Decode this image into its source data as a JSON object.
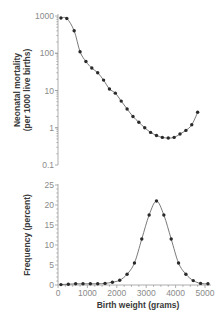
{
  "chart_data": [
    {
      "type": "line",
      "title": "",
      "xlabel": "",
      "ylabel": "Neonatal mortality (per 1000 live births)",
      "ylabel_lines": [
        "Neonatal mortality",
        "(per 1000 live births)"
      ],
      "yscale": "log",
      "ylim": [
        0.1,
        1000
      ],
      "xlim": [
        0,
        5200
      ],
      "yticks": [
        1000,
        100,
        10,
        1,
        0.1
      ],
      "ytick_labels": [
        "1000",
        "100",
        "10",
        "1",
        "0.1"
      ],
      "grid": false,
      "series": [
        {
          "name": "Neonatal mortality",
          "x": [
            100,
            300,
            550,
            750,
            950,
            1150,
            1350,
            1550,
            1750,
            1950,
            2150,
            2350,
            2550,
            2750,
            2950,
            3150,
            3350,
            3550,
            3750,
            3950,
            4150,
            4350,
            4550,
            4750
          ],
          "y": [
            880,
            860,
            400,
            110,
            60,
            40,
            30,
            19,
            11,
            8.5,
            5.2,
            3.2,
            2.0,
            1.4,
            1.0,
            0.75,
            0.62,
            0.55,
            0.53,
            0.55,
            0.68,
            0.85,
            1.2,
            2.6
          ]
        }
      ]
    },
    {
      "type": "line",
      "title": "",
      "xlabel": "Birth weight (grams)",
      "ylabel": "Frequency (percent)",
      "ylim": [
        0,
        25
      ],
      "xlim": [
        0,
        5200
      ],
      "yticks": [
        0,
        5,
        10,
        15,
        20,
        25
      ],
      "ytick_labels": [
        "0",
        "5",
        "10",
        "15",
        "20",
        "25"
      ],
      "xticks": [
        0,
        1000,
        2000,
        3000,
        4000,
        5000
      ],
      "xtick_labels": [
        "0",
        "1000",
        "2000",
        "3000",
        "4000",
        "5000"
      ],
      "grid": false,
      "series": [
        {
          "name": "Birth weight frequency",
          "x": [
            100,
            350,
            600,
            850,
            1100,
            1350,
            1600,
            1850,
            2100,
            2350,
            2600,
            2850,
            3100,
            3350,
            3600,
            3850,
            4100,
            4350,
            4600,
            4850,
            5100
          ],
          "y": [
            0.1,
            0.2,
            0.3,
            0.3,
            0.3,
            0.3,
            0.4,
            0.7,
            1.2,
            2.7,
            5.5,
            11.5,
            17.5,
            21,
            17.5,
            11.5,
            5.5,
            2.7,
            1.1,
            0.4,
            0.3
          ]
        }
      ]
    }
  ]
}
